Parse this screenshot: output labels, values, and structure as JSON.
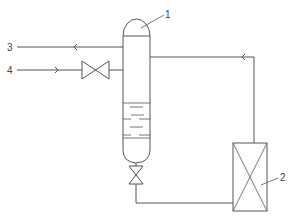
{
  "diagram": {
    "type": "process-flow",
    "line_color": "#555555",
    "labels": {
      "vessel": "1",
      "heat_exchanger": "2",
      "stream_out": "3",
      "stream_in": "4"
    },
    "components": [
      {
        "id": "1",
        "kind": "vessel-with-liquid"
      },
      {
        "id": "2",
        "kind": "heat-exchanger"
      },
      {
        "id": "valve-inlet",
        "kind": "gate-valve"
      },
      {
        "id": "valve-bottom",
        "kind": "gate-valve"
      }
    ],
    "streams": [
      {
        "id": "3",
        "direction": "out-left",
        "from": "vessel-1"
      },
      {
        "id": "4",
        "direction": "in-right",
        "to": "vessel-1",
        "via": "valve-inlet"
      },
      {
        "id": "recycle",
        "from": "heat-exchanger-2",
        "to": "vessel-1"
      },
      {
        "id": "bottoms",
        "from": "vessel-1",
        "to": "heat-exchanger-2",
        "via": "valve-bottom"
      }
    ]
  }
}
